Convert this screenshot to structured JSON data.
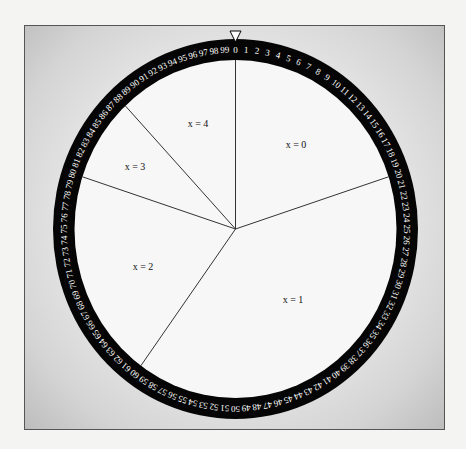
{
  "diagram": {
    "type": "circular-dial",
    "ring": {
      "numbers_start": 0,
      "numbers_end": 99,
      "count": 100,
      "ring_color": "#000000",
      "number_color": "#ffffff"
    },
    "pointer": {
      "position_number": 0,
      "shape": "down-triangle"
    },
    "spokes_at_numbers": [
      0,
      20,
      60,
      80,
      88
    ],
    "sectors": [
      {
        "label_var": "x",
        "label": "x = 0",
        "from": 0,
        "to": 20
      },
      {
        "label_var": "x",
        "label": "x = 1",
        "from": 20,
        "to": 60
      },
      {
        "label_var": "x",
        "label": "x = 2",
        "from": 60,
        "to": 80
      },
      {
        "label_var": "x",
        "label": "x = 3",
        "from": 80,
        "to": 88
      },
      {
        "label_var": "x",
        "label": "x = 4",
        "from": 88,
        "to": 100
      }
    ],
    "labels": {
      "x0": "x = 0",
      "x1": "x = 1",
      "x2": "x = 2",
      "x3": "x = 3",
      "x4": "x = 4"
    }
  }
}
